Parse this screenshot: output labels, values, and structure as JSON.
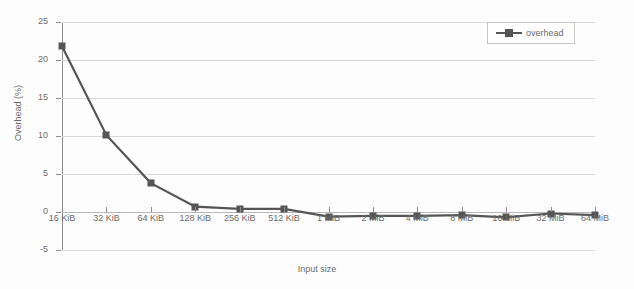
{
  "chart_data": {
    "type": "line",
    "title": "",
    "xlabel": "Input size",
    "ylabel": "Overhead (%)",
    "categories": [
      "16 KiB",
      "32 KiB",
      "64 KiB",
      "128 KiB",
      "256 KiB",
      "512 KiB",
      "1 MiB",
      "2 MiB",
      "4 MiB",
      "8 MiB",
      "16 MiB",
      "32 MiB",
      "64 MiB"
    ],
    "series": [
      {
        "name": "overhead",
        "values": [
          21.8,
          10.1,
          3.8,
          0.7,
          0.4,
          0.4,
          -0.6,
          -0.5,
          -0.5,
          -0.4,
          -0.7,
          -0.2,
          -0.4
        ]
      }
    ],
    "ylim": [
      -5,
      25
    ],
    "yticks": [
      25,
      20,
      15,
      10,
      5,
      0,
      -5
    ],
    "ytick_labels": [
      "25",
      "20",
      "15",
      "10",
      "5",
      "0",
      "-5"
    ],
    "grid": true,
    "legend_position": "top-right",
    "colors": {
      "series": "#555555",
      "grid": "#d9d9d9",
      "axis": "#8d8d8d",
      "text": "#6b6b6b",
      "background": "#fdfdfd"
    }
  },
  "legend": {
    "entries": [
      {
        "label": "overhead",
        "marker": "square-line-marker"
      }
    ]
  }
}
